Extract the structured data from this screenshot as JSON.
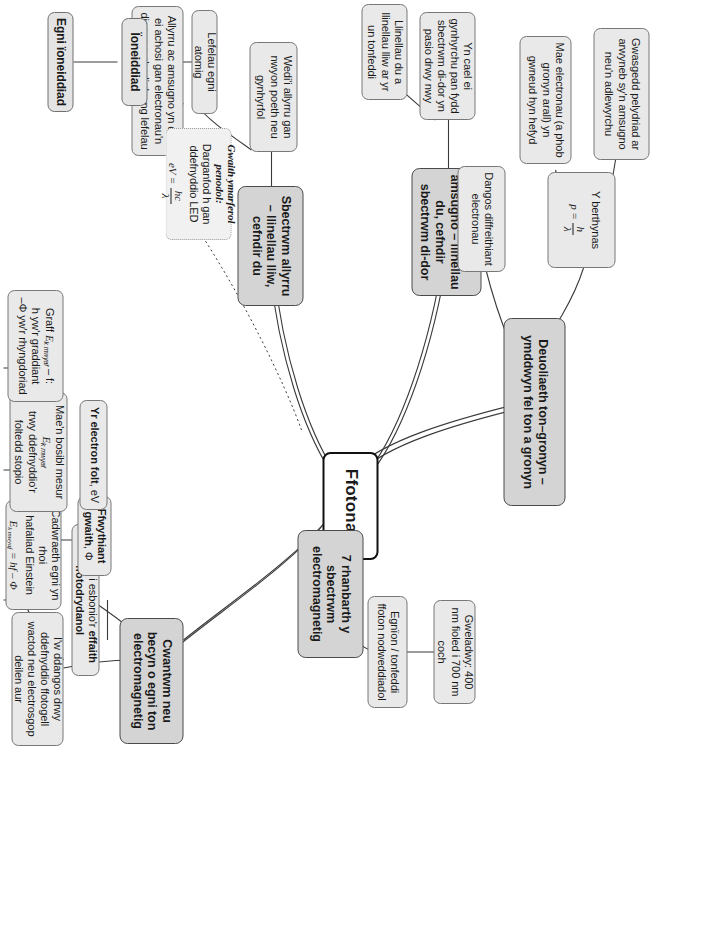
{
  "diagram": {
    "title": "Ffotonau",
    "type": "mind-map",
    "orientation": "rotated-90",
    "colors": {
      "root_fill": "#ffffff",
      "root_border": "#111111",
      "level1_fill": "#d4d4d4",
      "level2_fill": "#e9e9e9",
      "level3_fill": "#efefef",
      "line": "#3a3a3a"
    }
  },
  "root": {
    "label": "Ffotonau"
  },
  "branches": {
    "duoliaeth": {
      "label": "Deuoliaeth ton–gronyn – ymddwyn fel ton a gronyn",
      "children": {
        "perthynas_label": "Y berthynas",
        "perthynas_formula_p": "p =",
        "perthynas_formula_num": "h",
        "perthynas_formula_den": "λ",
        "gwasgedd": "Gwasgedd pelydriad ar arwyneb sy'n amsugno neu'n adlewyrchu",
        "diffreithiant": "Dangos diffreithiant electronau",
        "electronau": "Mae electronau (a phob gronyn arall) yn gwneud hyn hefyd"
      }
    },
    "amsugno": {
      "label": "Sbectrwm amsugno – llinellau du, cefndir sbectrwm di-dor",
      "children": {
        "cynhyrchu": "Yn cael ei gynhyrchu pan fydd sbectrwm di-dor yn pasio drwy nwy",
        "llinellau": "Llinellau du a llinellau lliw ar yr un tonfeddi"
      }
    },
    "allyrru": {
      "label": "Sbectrwm allyrru – llinellau lliw, cefndir du",
      "children": {
        "nwyon": "Wedi'i allyrru gan nwyon poeth neu gynhyrfol",
        "lefelau": "Lefelau egni atomig",
        "achosi": "Allyrru ac amsugno yn cael ei achosi gan electronau'n disgyn a chodi rhwng lefelau",
        "ioneiddiad": "Ïoneiddiad",
        "egni_ioneiddiad": "Egni ïoneiddiad"
      }
    },
    "rhanbarth": {
      "label": "7 rhanbarth y sbectrwm electromagnetig",
      "children": {
        "egnion": "Egnïon / tonfeddi ffoton nodweddiadol",
        "gweladwy": "Gweladwy: 400 nm fioled i 700 nm coch"
      }
    },
    "cwantwm": {
      "label": "Cwantwm neu becyn o egni ton electromagnetig",
      "children": {
        "esbonio_pre": "I'w weld i esbonio'r ",
        "esbonio_bold": "effaith ffotodrydanol",
        "dangos": "I'w ddangos drwy ddefnyddio ffotogell wactod neu electrosgop deilen aur",
        "cadwraeth_line1": "Cadwraeth egni yn rhoi",
        "cadwraeth_line2": "hafaliad Einstein",
        "cadwraeth_eq_lhs": "E",
        "cadwraeth_eq_sub": "k mwyaf",
        "cadwraeth_eq_rhs": "= hf – Φ",
        "ffwythiant_bold": "Ffwythiant gwaith",
        "ffwythiant_sym": ", Φ",
        "electronfolt_bold": "Yr electron folt",
        "electronfolt_sym": ", eV",
        "mesur_line1": "Mae'n bosibl mesur",
        "mesur_sym": "E",
        "mesur_sub": "k mwyaf",
        "mesur_line2": "trwy ddefnyddio'r foltedd stopio",
        "graff_line1": "Graff ",
        "graff_sym": "E",
        "graff_sub": "k mwyaf",
        "graff_line1b": " – f:",
        "graff_line2": "h yw'r graddiant",
        "graff_line3": "–Φ yw'r rhyngdoriad"
      }
    }
  },
  "practical": {
    "heading": "Gwaith ymarferol penodol:",
    "text": "Darganfod h gan ddefnyddio LED",
    "eq_lhs": "eV =",
    "eq_num": "hc",
    "eq_den": "λ"
  }
}
